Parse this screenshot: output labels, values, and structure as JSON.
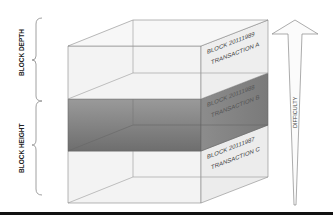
{
  "diagram": {
    "left_brackets": [
      {
        "label": "BLOCK DEPTH"
      },
      {
        "label": "BLOCK HEIGHT"
      }
    ],
    "blocks": [
      {
        "block": "BLOCK 20111989",
        "transaction": "TRANSACTION A",
        "fill": "#f0f0f0"
      },
      {
        "block": "BLOCK 20111988",
        "transaction": "TRANSACTION B",
        "fill": "#8a8a8a"
      },
      {
        "block": "BLOCK 20111987",
        "transaction": "TRANSACTION C",
        "fill": "#f2f2f2"
      }
    ],
    "arrow": {
      "label": "DIFFICULTY"
    },
    "colors": {
      "edge": "#777777",
      "dark_layer": "#8a8a8a",
      "light_layer": "#f0f0f0",
      "bottom_rule": "#111111"
    }
  }
}
